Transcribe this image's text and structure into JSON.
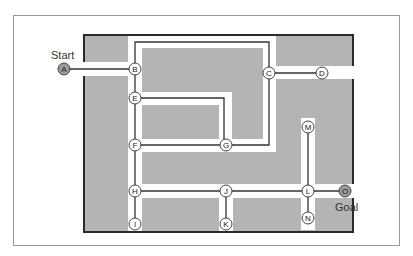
{
  "diagram": {
    "start_label": "Start",
    "goal_label": "Goal",
    "colors": {
      "wall_fill": "#b4b4b4",
      "corridor": "#ffffff",
      "border": "#2a2a2a",
      "path_line": "#333333",
      "node_fill": "#ffffff",
      "terminal_node_fill": "#9a9a9a",
      "frame": "#9a9a9a"
    },
    "nodes": [
      {
        "id": "A",
        "x": 64,
        "y": 69,
        "type": "start"
      },
      {
        "id": "B",
        "x": 135,
        "y": 69
      },
      {
        "id": "C",
        "x": 269,
        "y": 73
      },
      {
        "id": "D",
        "x": 322,
        "y": 73
      },
      {
        "id": "E",
        "x": 135,
        "y": 98
      },
      {
        "id": "F",
        "x": 135,
        "y": 145
      },
      {
        "id": "G",
        "x": 226,
        "y": 145
      },
      {
        "id": "H",
        "x": 135,
        "y": 191
      },
      {
        "id": "I",
        "x": 135,
        "y": 224
      },
      {
        "id": "J",
        "x": 226,
        "y": 191
      },
      {
        "id": "K",
        "x": 226,
        "y": 224
      },
      {
        "id": "L",
        "x": 308,
        "y": 191
      },
      {
        "id": "M",
        "x": 308,
        "y": 127
      },
      {
        "id": "N",
        "x": 308,
        "y": 218
      },
      {
        "id": "O",
        "x": 345,
        "y": 191,
        "type": "goal"
      }
    ],
    "edges": [
      [
        "A",
        "B"
      ],
      [
        "B",
        "C"
      ],
      [
        "C",
        "D"
      ],
      [
        "B",
        "E"
      ],
      [
        "E",
        "G"
      ],
      [
        "E",
        "F"
      ],
      [
        "C",
        "G"
      ],
      [
        "F",
        "G"
      ],
      [
        "F",
        "H"
      ],
      [
        "H",
        "I"
      ],
      [
        "H",
        "J"
      ],
      [
        "J",
        "K"
      ],
      [
        "J",
        "L"
      ],
      [
        "L",
        "M"
      ],
      [
        "L",
        "N"
      ],
      [
        "L",
        "O"
      ]
    ]
  }
}
